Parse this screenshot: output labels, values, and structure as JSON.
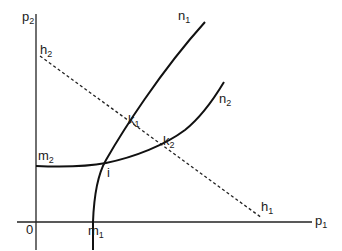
{
  "figure": {
    "axes": {
      "x_label": "p",
      "x_label_sub": "1",
      "y_label": "p",
      "y_label_sub": "2",
      "origin_label": "0"
    },
    "curves": [
      {
        "name": "n",
        "sub": "1",
        "style": "solid"
      },
      {
        "name": "n",
        "sub": "2",
        "style": "solid"
      },
      {
        "name": "h-line",
        "style": "dashed"
      }
    ],
    "points": {
      "h2": {
        "name": "h",
        "sub": "2"
      },
      "h1": {
        "name": "h",
        "sub": "1"
      },
      "m1": {
        "name": "m",
        "sub": "1"
      },
      "m2": {
        "name": "m",
        "sub": "2"
      },
      "k1": {
        "name": "k",
        "sub": "1"
      },
      "k2": {
        "name": "k",
        "sub": "2"
      },
      "i": {
        "name": "i"
      }
    },
    "colors": {
      "line": "#111111",
      "background": "#ffffff"
    }
  }
}
